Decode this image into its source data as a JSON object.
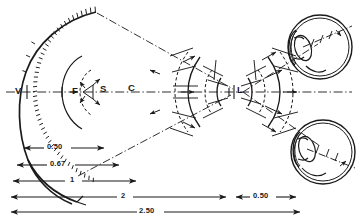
{
  "figure": {
    "type": "optical-schematic",
    "point_labels": [
      {
        "id": "V",
        "text": "V",
        "x": 18,
        "y": 92,
        "meaning": "vertex-of-wavefront"
      },
      {
        "id": "F",
        "text": "F",
        "x": 75,
        "y": 92,
        "meaning": "focus-point"
      },
      {
        "id": "S",
        "text": "S",
        "x": 96,
        "y": 91,
        "meaning": "source-point"
      },
      {
        "id": "C",
        "text": "C",
        "x": 130,
        "y": 89,
        "meaning": "center-of-curvature"
      },
      {
        "id": "L",
        "text": "L",
        "x": 240,
        "y": 92,
        "meaning": "lens-waist-point"
      }
    ],
    "dimensions": [
      {
        "value": "0.50",
        "label_x": 52,
        "label_y": 143,
        "line_y": 148,
        "x_start": 22,
        "x_end": 104
      },
      {
        "value": "0.67",
        "label_x": 57,
        "label_y": 160,
        "line_y": 165,
        "x_start": 15,
        "x_end": 118
      },
      {
        "value": "1",
        "label_x": 73,
        "label_y": 176,
        "line_y": 181,
        "x_start": 11,
        "x_end": 135
      },
      {
        "value": "2",
        "label_x": 125,
        "label_y": 192,
        "line_y": 197,
        "x_start": 10,
        "x_end": 243
      },
      {
        "value": "2.50",
        "label_x": 145,
        "label_y": 208,
        "line_y": 212,
        "x_start": 10,
        "x_end": 300
      },
      {
        "value": "0.50",
        "label_x": 258,
        "label_y": 192,
        "line_y": 197,
        "x_start": 228,
        "x_end": 286
      }
    ],
    "colors": {
      "ink": "#1a1a1a",
      "background": "#ffffff",
      "hatching": "#2a2a2a"
    },
    "elements": {
      "main_wavefront_arc": "large hatched arc on the left",
      "inner_arcs": "two concentric arcs around F",
      "beam_cone": "dash-dot cone converging from left arc to waist near L",
      "wave_fronts": "dashed and solid arcs along the converging beam",
      "eye_upper": "eye model, upper right",
      "eye_lower": "eye model, lower right",
      "optical_axis": "horizontal dash-dot centre line"
    }
  }
}
